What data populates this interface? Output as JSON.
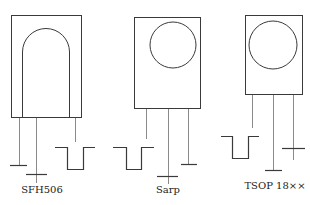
{
  "components": [
    {
      "id": "sfh506",
      "label": "SFH506",
      "window_shape": "arch",
      "pin_order": [
        "ground",
        "supply",
        "output"
      ]
    },
    {
      "id": "sarp",
      "label": "Sarp",
      "window_shape": "circle",
      "pin_order": [
        "output",
        "supply",
        "ground"
      ]
    },
    {
      "id": "tsop18xx",
      "label": "TSOP 18××",
      "window_shape": "circle",
      "pin_order": [
        "output",
        "ground",
        "supply"
      ]
    }
  ],
  "symbols": {
    "ground": "ground-symbol",
    "supply": "plus-symbol",
    "output": "pulse-signal"
  },
  "colors": {
    "outline": "#3a3a3a",
    "pin": "#8a8a8a",
    "background": "#ffffff"
  }
}
